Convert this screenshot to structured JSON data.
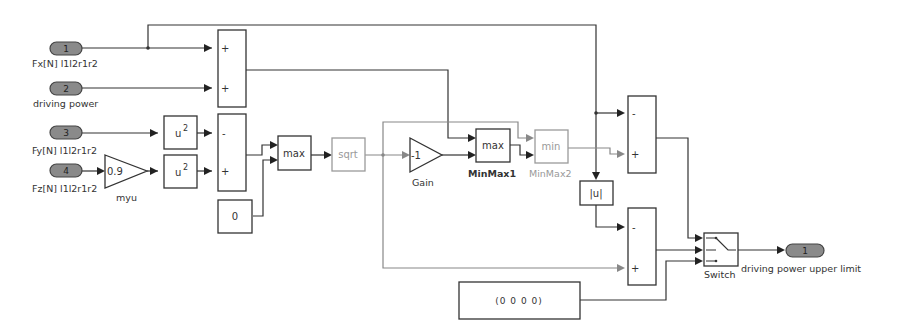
{
  "inports": [
    {
      "num": "1",
      "label": "Fx[N] l1l2r1r2"
    },
    {
      "num": "2",
      "label": "driving power"
    },
    {
      "num": "3",
      "label": "Fy[N] l1l2r1r2"
    },
    {
      "num": "4",
      "label": "Fz[N] l1l2r1r2"
    }
  ],
  "outport": {
    "num": "1",
    "label": "driving power  upper limit"
  },
  "blocks": {
    "square1": {
      "text": "u",
      "sup": "2"
    },
    "square2": {
      "text": "u",
      "sup": "2"
    },
    "myu_gain": {
      "value": "0.9",
      "label": "myu"
    },
    "const_zero": {
      "value": "0"
    },
    "max_block": {
      "text": "max"
    },
    "sqrt_block": {
      "text": "sqrt"
    },
    "gain": {
      "value": "-1",
      "label": "Gain"
    },
    "minmax1": {
      "text": "max",
      "label": "MinMax1"
    },
    "minmax2": {
      "text": "min",
      "label": "MinMax2"
    },
    "abs_block": {
      "text": "|u|"
    },
    "switch": {
      "label": "Switch"
    },
    "const_vector": {
      "value": "(0   0   0   0)"
    }
  },
  "sum_signs": {
    "sum1": [
      "+",
      "+"
    ],
    "sum2": [
      "-",
      "+"
    ],
    "sum3": [
      "-",
      "+"
    ],
    "sum4": [
      "-",
      "+"
    ]
  },
  "colors": {
    "line": "#333333",
    "dim_line": "#888888",
    "port_fill": "#8a8a8a"
  }
}
